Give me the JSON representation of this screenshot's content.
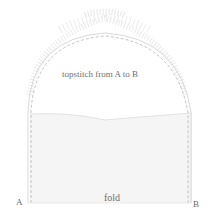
{
  "diagram": {
    "type": "sewing-instruction",
    "labels": {
      "instruction": "topstitch from A to B",
      "fold": "fold",
      "point_a": "A",
      "point_b": "B"
    },
    "colors": {
      "outline": "#c8c8c8",
      "stitch": "#b0b0b0",
      "lower_fill": "#f4f4f4",
      "ruffle": "#dcdcdc",
      "text": "#707070"
    }
  }
}
